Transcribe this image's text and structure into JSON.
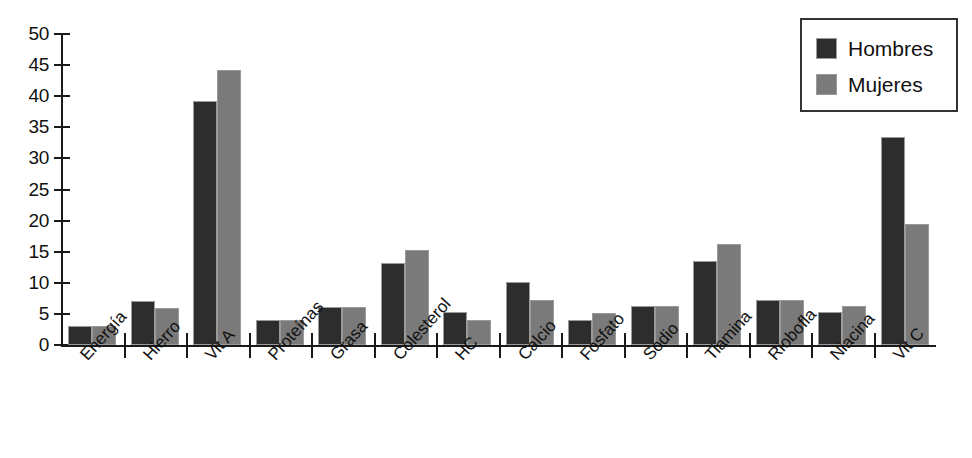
{
  "chart_data": {
    "type": "bar",
    "title": "",
    "xlabel": "",
    "ylabel": "",
    "ylim": [
      0,
      50
    ],
    "yticks": [
      0,
      5,
      10,
      15,
      20,
      25,
      30,
      35,
      40,
      45,
      50
    ],
    "grid": false,
    "legend_position": "top-right",
    "categories": [
      "Energía",
      "Hierro",
      "Vit A",
      "Proteínas",
      "Grasa",
      "Colesterol",
      "HC",
      "Calcio",
      "Fosfato",
      "Sodio",
      "Tiamina",
      "Riobofla",
      "Niacina",
      "Vit C"
    ],
    "series": [
      {
        "name": "Hombres",
        "color": "#2d2d2d",
        "values": [
          3.0,
          7.1,
          39.2,
          4.0,
          6.1,
          13.2,
          5.3,
          10.2,
          4.1,
          6.2,
          13.5,
          7.3,
          5.3,
          33.5
        ]
      },
      {
        "name": "Mujeres",
        "color": "#7a7a7a",
        "values": [
          3.0,
          6.0,
          44.2,
          4.0,
          6.1,
          15.2,
          4.1,
          7.2,
          5.2,
          6.2,
          16.3,
          7.3,
          6.3,
          19.5
        ]
      }
    ]
  },
  "legend": {
    "items": [
      {
        "label": "Hombres",
        "color": "#2d2d2d"
      },
      {
        "label": "Mujeres",
        "color": "#7a7a7a"
      }
    ]
  }
}
